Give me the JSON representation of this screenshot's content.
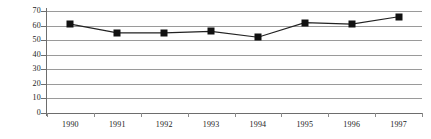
{
  "chart_data": {
    "type": "line",
    "title": "",
    "subtitle": "",
    "xlabel": "",
    "ylabel": "",
    "categories": [
      "1990",
      "1991",
      "1992",
      "1993",
      "1994",
      "1995",
      "1996",
      "1997"
    ],
    "values": [
      61,
      55,
      55,
      56,
      52,
      62,
      61,
      66
    ],
    "series": [
      {
        "name": "",
        "values": [
          61,
          55,
          55,
          56,
          52,
          62,
          61,
          66
        ],
        "line_color": "#222222",
        "marker_color": "#111111",
        "marker_shape": "square"
      }
    ],
    "ylim": [
      0,
      70
    ],
    "yticks": [
      0,
      10,
      20,
      30,
      40,
      50,
      60,
      70
    ],
    "ytick_labels": [
      "0",
      "10",
      "20",
      "30",
      "40",
      "50",
      "60",
      "70"
    ],
    "grid": true,
    "grid_axis": "y",
    "grid_color": "#9a9a9a",
    "legend": false,
    "legend_position": "none",
    "annotations": [],
    "background_color": "#ffffff",
    "axis_color": "#6d6d6d"
  },
  "axes": {
    "y_labels": [
      "70",
      "60",
      "50",
      "40",
      "30",
      "20",
      "10",
      "0"
    ],
    "x_labels": [
      "1990",
      "1991",
      "1992",
      "1993",
      "1994",
      "1995",
      "1996",
      "1997"
    ]
  }
}
